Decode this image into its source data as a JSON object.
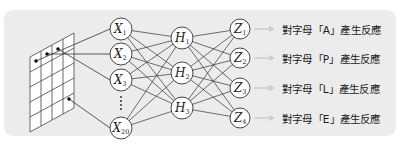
{
  "diagram": {
    "colors": {
      "panel_background": "#ececec",
      "line": "#333333",
      "node_fill": "#ffffff",
      "arrow": "#c8c8c8",
      "text": "#1a1a1a"
    },
    "input_grid": {
      "columns": 4,
      "rows": 5,
      "marked_cells": 4
    },
    "input_layer": [
      {
        "id": "X1",
        "letter": "X",
        "sub": "1"
      },
      {
        "id": "X2",
        "letter": "X",
        "sub": "2"
      },
      {
        "id": "X3",
        "letter": "X",
        "sub": "3"
      },
      {
        "id": "X20",
        "letter": "X",
        "sub": "20"
      }
    ],
    "ellipsis": "⋮",
    "hidden_layer": [
      {
        "id": "H1",
        "letter": "H",
        "sub": "1"
      },
      {
        "id": "H2",
        "letter": "H",
        "sub": "2"
      },
      {
        "id": "H3",
        "letter": "H",
        "sub": "3"
      }
    ],
    "output_layer": [
      {
        "id": "Z1",
        "letter": "Z",
        "sub": "1",
        "label": "對字母「A」產生反應"
      },
      {
        "id": "Z2",
        "letter": "Z",
        "sub": "2",
        "label": "對字母「P」產生反應"
      },
      {
        "id": "Z3",
        "letter": "Z",
        "sub": "3",
        "label": "對字母「L」產生反應"
      },
      {
        "id": "Z4",
        "letter": "Z",
        "sub": "4",
        "label": "對字母「E」產生反應"
      }
    ]
  }
}
